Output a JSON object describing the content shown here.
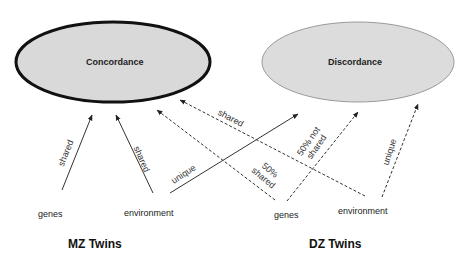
{
  "nodes": {
    "concordance": "Concordance",
    "discordance": "Discordance"
  },
  "sources": {
    "mz_genes": "genes",
    "mz_environment": "environment",
    "dz_genes": "genes",
    "dz_environment": "environment"
  },
  "groups": {
    "mz": "MZ Twins",
    "dz": "DZ Twins"
  },
  "edge_labels": {
    "mz_genes_shared": "shared",
    "mz_env_shared": "shared",
    "mz_env_unique": "unique",
    "dz_env_shared": "shared",
    "dz_genes_50_shared_1": "50%",
    "dz_genes_50_shared_2": "shared",
    "dz_genes_50_not_shared_1": "50% not",
    "dz_genes_50_not_shared_2": "shared",
    "dz_env_unique": "unique"
  },
  "colors": {
    "ellipse_fill": "#d9d9d9",
    "concordance_border": "#111111",
    "discordance_border": "#9a9a9a",
    "line": "#333333"
  }
}
